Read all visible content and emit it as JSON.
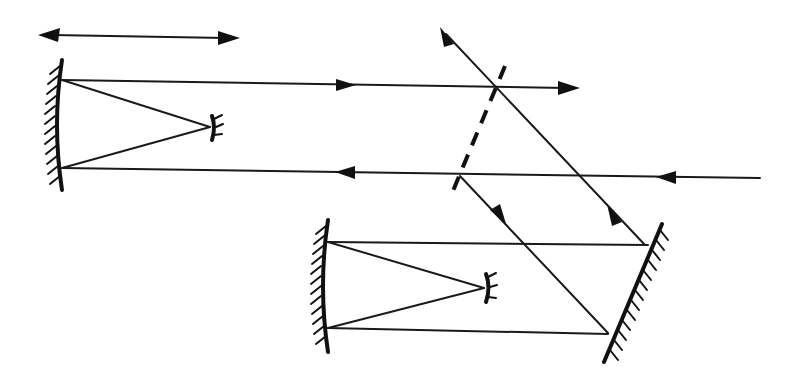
{
  "diagram": {
    "type": "optical-schematic",
    "colors": {
      "ink": "#111111",
      "background": "#ffffff"
    },
    "components": [
      {
        "id": "translation-arrow",
        "kind": "double-headed-arrow",
        "from": [
          38,
          35
        ],
        "to": [
          240,
          38
        ]
      },
      {
        "id": "upper-primary-mirror",
        "kind": "concave-mirror",
        "top": [
          62,
          62
        ],
        "bottom": [
          62,
          188
        ],
        "hatch_side": "left"
      },
      {
        "id": "upper-secondary-mirror",
        "kind": "convex-mirror",
        "center": [
          214,
          127
        ]
      },
      {
        "id": "beam-splitter",
        "kind": "dashed-plate",
        "from": [
          505,
          65
        ],
        "to": [
          450,
          198
        ]
      },
      {
        "id": "lower-primary-mirror",
        "kind": "concave-mirror",
        "top": [
          328,
          222
        ],
        "bottom": [
          328,
          350
        ],
        "hatch_side": "left"
      },
      {
        "id": "lower-secondary-mirror",
        "kind": "convex-mirror",
        "center": [
          488,
          287
        ]
      },
      {
        "id": "fold-mirror",
        "kind": "flat-mirror",
        "from": [
          662,
          225
        ],
        "to": [
          605,
          360
        ],
        "hatch_side": "right"
      }
    ],
    "rays": [
      {
        "id": "input-ray",
        "points": [
          [
            760,
            178
          ],
          [
            460,
            176
          ]
        ],
        "arrow_at": [
          670,
          178
        ],
        "direction": "left"
      },
      {
        "id": "upper-lower-ray",
        "points": [
          [
            460,
            176
          ],
          [
            62,
            168
          ]
        ],
        "arrow_at": [
          345,
          172
        ],
        "direction": "left"
      },
      {
        "id": "upper-top-ray",
        "points": [
          [
            62,
            80
          ],
          [
            580,
            88
          ]
        ],
        "arrow_at": [
          345,
          85
        ],
        "direction": "right",
        "arrow_end": true
      },
      {
        "id": "split-down-ray",
        "points": [
          [
            460,
            176
          ],
          [
            608,
            332
          ]
        ],
        "arrow_at": [
          505,
          222
        ],
        "direction": "down-right"
      },
      {
        "id": "return-diagonal",
        "points": [
          [
            645,
            245
          ],
          [
            440,
            28
          ]
        ],
        "arrow_at": [
          612,
          210
        ],
        "direction": "up-left",
        "arrow_end": true
      }
    ],
    "labels": []
  }
}
